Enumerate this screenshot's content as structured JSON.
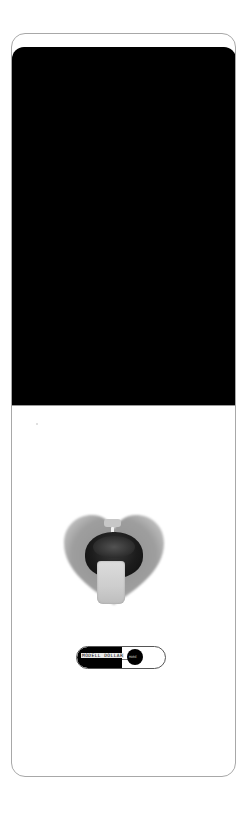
{
  "device": {
    "frame_color": "#a8a8a8",
    "screen_color": "#000000",
    "background": "#ffffff"
  },
  "product": {
    "name": "heart-shaped ring holder with ring",
    "heart_color": "#9a9a9a",
    "ring_color": "#1c1c1c",
    "slab_color": "#d2d2d2"
  },
  "toggle": {
    "label": "MODELL DOLLAR",
    "knob_text": "MORE",
    "left_color": "#000000",
    "right_color": "#ffffff"
  }
}
